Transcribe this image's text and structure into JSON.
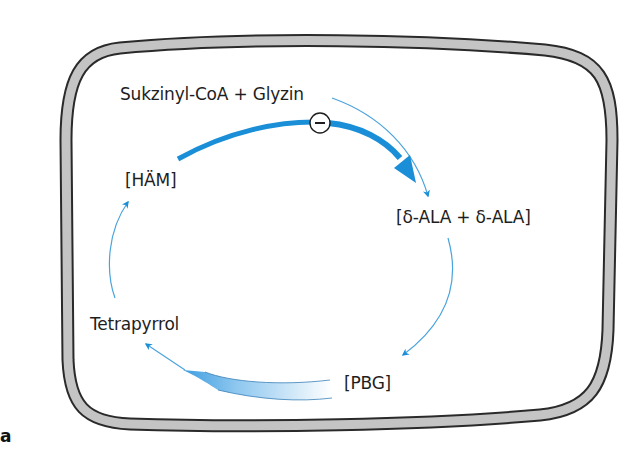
{
  "figure": {
    "panel_label": "a",
    "colors": {
      "membrane_fill": "#c4c4c4",
      "membrane_stroke": "#2a2a2a",
      "arrow_blue": "#1a8fd8",
      "thin_arrow_blue": "#4aa3dc",
      "text": "#1e1e1e"
    },
    "nodes": {
      "substrates": "Sukzinyl-CoA + Glyzin",
      "heme": "[HÄM]",
      "ala": "[δ-ALA + δ-ALA]",
      "tetrapyrrol": "Tetrapyrrol",
      "pbg": "[PBG]"
    },
    "inhibition_symbol": "−",
    "edges": [
      {
        "from": "substrates",
        "to": "ala",
        "style": "thin"
      },
      {
        "from": "heme",
        "to": "ala",
        "style": "thick",
        "type": "feedback-inhibition"
      },
      {
        "from": "ala",
        "to": "pbg",
        "style": "thin"
      },
      {
        "from": "pbg",
        "to": "tetrapyrrol",
        "style": "gradient-band"
      },
      {
        "from": "tetrapyrrol",
        "to": "heme",
        "style": "thin"
      }
    ]
  }
}
